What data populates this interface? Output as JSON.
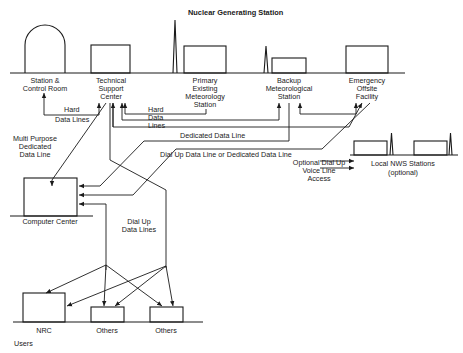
{
  "title": "Nuclear Generating Station",
  "stations": {
    "station_control_room": [
      "Station &",
      "Control Room"
    ],
    "technical_support_center": [
      "Technical",
      "Support",
      "Center"
    ],
    "primary_meteorology": [
      "Primary",
      "Existing",
      "Meteorology",
      "Station"
    ],
    "backup_meteorology": [
      "Backup",
      "Meteorological",
      "Station"
    ],
    "emergency_offsite": [
      "Emergency",
      "Offsite",
      "Facility"
    ]
  },
  "links": {
    "hard_data_lines_left": [
      "Hard",
      "Data Lines"
    ],
    "hard_data_lines_right": [
      "Hard",
      "Data",
      "Lines"
    ],
    "multi_purpose": [
      "Multi Purpose",
      "Dedicated",
      "Data Line"
    ],
    "dedicated_data_line": "Dedicated Data Line",
    "dial_up_or_dedicated": "Dial Up Data Line  or Dedicated Data Line",
    "optional_voice": [
      "Optional Dial Up",
      "Voice Line",
      "Access"
    ],
    "dial_up_data_lines": [
      "Dial Up",
      "Data Lines"
    ]
  },
  "local_nws": [
    "Local NWS Stations",
    "(optional)"
  ],
  "computer_center": "Computer Center",
  "users": {
    "heading": "Users",
    "items": [
      "NRC",
      "Others",
      "Others"
    ]
  },
  "colors": {
    "ink": "#1a1a1a",
    "background": "#ffffff"
  }
}
